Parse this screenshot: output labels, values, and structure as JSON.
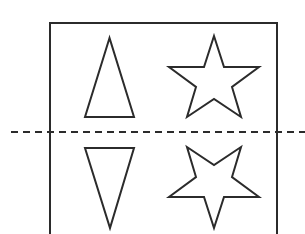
{
  "figure": {
    "stroke_color": "#2b2b2b",
    "background_color": "#ffffff",
    "mirror_line": {
      "style": "dashed",
      "orientation": "horizontal"
    },
    "frame": {
      "shape": "rectangle",
      "sides_visible": [
        "top",
        "left",
        "right"
      ]
    },
    "shapes_above_line": [
      {
        "name": "triangle",
        "orientation": "pointing-up"
      },
      {
        "name": "five-point-star",
        "orientation": "point-up"
      }
    ],
    "shapes_below_line": [
      {
        "name": "triangle",
        "orientation": "pointing-down"
      },
      {
        "name": "five-point-star",
        "orientation": "point-down"
      }
    ]
  }
}
